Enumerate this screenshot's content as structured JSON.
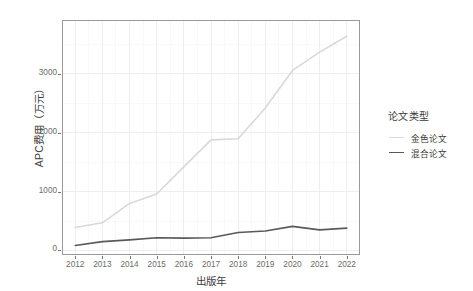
{
  "chart_data": {
    "type": "line",
    "title": "",
    "xlabel": "出版年",
    "ylabel": "APC费用（万元）",
    "x": [
      2012,
      2013,
      2014,
      2015,
      2016,
      2017,
      2018,
      2019,
      2020,
      2021,
      2022
    ],
    "xticklabels": [
      "2012",
      "2013",
      "2014",
      "2015",
      "2016",
      "2017",
      "2018",
      "2019",
      "2020",
      "2021",
      "2022"
    ],
    "yticklabels": [
      "0",
      "1000",
      "2000",
      "3000"
    ],
    "yticks": [
      0,
      1000,
      2000,
      3000
    ],
    "ylim": [
      -60,
      3900
    ],
    "xlim": [
      2011.55,
      2022.45
    ],
    "grid": true,
    "legend_position": "right",
    "series": [
      {
        "name": "金色论文",
        "color": "#d9d9d9",
        "linewidth": 1.6,
        "values": [
          390,
          470,
          800,
          960,
          1420,
          1880,
          1900,
          2420,
          3060,
          3370,
          3640
        ]
      },
      {
        "name": "混合论文",
        "color": "#595959",
        "linewidth": 1.6,
        "values": [
          85,
          150,
          180,
          215,
          210,
          215,
          305,
          330,
          410,
          350,
          380
        ]
      }
    ]
  },
  "legend": {
    "title": "论文类型",
    "entries": [
      {
        "label": "金色论文",
        "color": "#d9d9d9"
      },
      {
        "label": "混合论文",
        "color": "#595959"
      }
    ]
  },
  "colors": {
    "panel_border": "#9a9a9a",
    "grid_major": "#ececec",
    "grid_minor": "#f6f6f6",
    "axis_text": "#6b6b6b",
    "title_text": "#3a3a3a",
    "background": "#ffffff"
  }
}
